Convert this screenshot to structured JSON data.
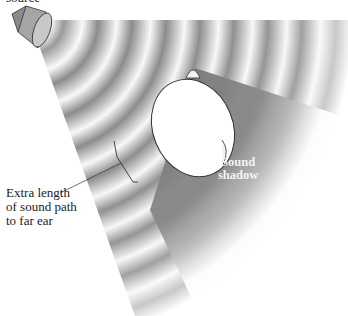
{
  "figure": {
    "type": "diagram",
    "labels": {
      "source_line1": "source",
      "extra_line1": "Extra length",
      "extra_line2": "of sound path",
      "extra_line3": "to far ear",
      "shadow_line1": "Sound",
      "shadow_line2": "shadow"
    },
    "elements": {
      "speaker": "speaker-icon",
      "head": "head-top-view",
      "wavefronts": "concentric-sound-waves",
      "shadow_region": "sound-shadow-wedge",
      "bracket": "path-length-bracket"
    },
    "colors": {
      "background": "#ffffff",
      "wave_dark": "#8a8a8a",
      "wave_light": "#f5f5f5",
      "shadow": "#7a7a7a",
      "head_fill": "#ffffff",
      "outline": "#333333"
    }
  }
}
